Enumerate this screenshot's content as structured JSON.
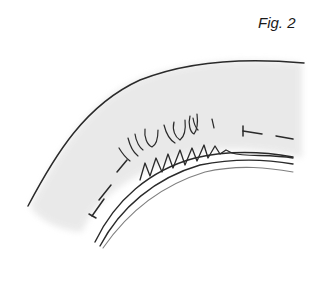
{
  "figure": {
    "label": "Fig. 2",
    "colors": {
      "ink": "#2a2a2a",
      "shading": "#e6e6e6",
      "background": "#ffffff"
    }
  }
}
